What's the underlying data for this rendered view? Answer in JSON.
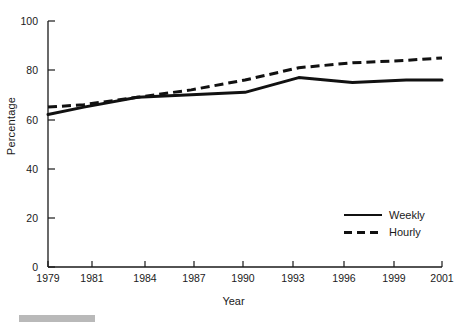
{
  "chart_data": {
    "type": "line",
    "title": "",
    "xlabel": "Year",
    "ylabel": "Percentage",
    "xlim": [
      1979,
      2001
    ],
    "ylim": [
      0,
      100
    ],
    "grid": false,
    "legend_position": "bottom-right",
    "xticks": [
      "1979",
      "1981",
      "1984",
      "1987",
      "1990",
      "1993",
      "1996",
      "1999",
      "2001"
    ],
    "xtick_values": [
      1979,
      1981,
      1984,
      1987,
      1990,
      1993,
      1996,
      1999,
      2001
    ],
    "yticks": [
      "0",
      "20",
      "40",
      "60",
      "80",
      "100"
    ],
    "ytick_values": [
      0,
      20,
      40,
      60,
      80,
      100
    ],
    "x": [
      1979,
      1981,
      1984,
      1987,
      1990,
      1993,
      1996,
      1999,
      2001
    ],
    "series": [
      {
        "name": "Weekly",
        "style": "solid",
        "color": "#111111",
        "values": [
          62,
          65,
          69,
          70,
          71,
          77,
          75,
          76,
          76
        ]
      },
      {
        "name": "Hourly",
        "style": "dashed",
        "color": "#111111",
        "values": [
          65,
          66,
          69,
          72,
          76,
          81,
          83,
          84,
          85
        ]
      }
    ]
  },
  "axes": {
    "y_title": "Percentage",
    "x_title": "Year",
    "y_tick_labels": [
      "100",
      "80",
      "60",
      "40",
      "20",
      "0"
    ],
    "x_tick_labels": [
      "1979",
      "1981",
      "1984",
      "1987",
      "1990",
      "1993",
      "1996",
      "1999",
      "2001"
    ]
  },
  "legend": {
    "items": [
      {
        "label": "Weekly",
        "style": "solid"
      },
      {
        "label": "Hourly",
        "style": "dashed"
      }
    ]
  },
  "caption": {
    "badge_label": "",
    "text": ""
  }
}
